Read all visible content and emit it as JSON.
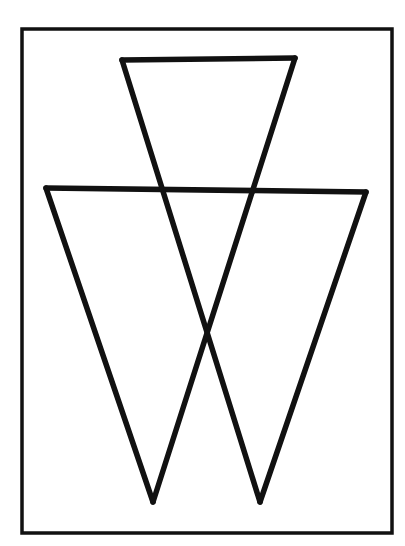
{
  "figure": {
    "width": 405,
    "height": 546,
    "background": "#ffffff",
    "stroke_color": "#111111",
    "frame": {
      "x": 22,
      "y": 29,
      "width": 370,
      "height": 504,
      "stroke_width": 3.5
    },
    "shapes": [
      {
        "name": "upper-small-inverted-triangle-top-edge",
        "points": [
          [
            122,
            60
          ],
          [
            295,
            58
          ]
        ],
        "stroke_width": 5.5
      },
      {
        "name": "large-inverted-triangle-top-edge",
        "points": [
          [
            46,
            188
          ],
          [
            366,
            192
          ]
        ],
        "stroke_width": 5.5
      },
      {
        "name": "large-triangle-left-side",
        "points": [
          [
            46,
            188
          ],
          [
            153,
            502
          ]
        ],
        "stroke_width": 5.5
      },
      {
        "name": "large-triangle-right-side",
        "points": [
          [
            366,
            192
          ],
          [
            260,
            502
          ]
        ],
        "stroke_width": 5.5
      },
      {
        "name": "long-diagonal-left-to-right",
        "points": [
          [
            122,
            60
          ],
          [
            260,
            502
          ]
        ],
        "stroke_width": 5.5
      },
      {
        "name": "long-diagonal-right-to-left",
        "points": [
          [
            295,
            58
          ],
          [
            153,
            502
          ]
        ],
        "stroke_width": 5.5
      }
    ],
    "key_points": {
      "center_crossing": [
        204,
        332
      ],
      "left_bottom_apex": [
        153,
        502
      ],
      "right_bottom_apex": [
        260,
        502
      ]
    }
  }
}
